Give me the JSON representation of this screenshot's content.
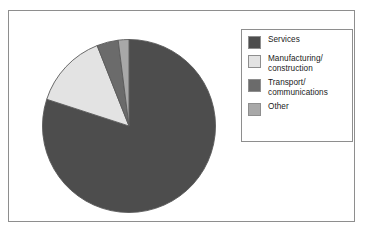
{
  "chart_data": {
    "type": "pie",
    "title": "",
    "subtitle": "",
    "xlabel": "",
    "ylabel": "",
    "grid": false,
    "legend_position": "right",
    "start_angle_deg": 90,
    "direction": "clockwise",
    "labels": [
      "Services",
      "Manufacturing/\nconstruction",
      "Transport/\ncommunications",
      "Other"
    ],
    "values": [
      80,
      14,
      4,
      2
    ],
    "unit": "percent",
    "colors": [
      "#4d4d4d",
      "#e3e3e3",
      "#6b6b6b",
      "#a8a8a8"
    ],
    "slice_edge_color": "#5a5a5a",
    "slices": [
      {
        "label": "Services",
        "value": 80,
        "color": "#4d4d4d"
      },
      {
        "label": "Manufacturing/\nconstruction",
        "value": 14,
        "color": "#e3e3e3"
      },
      {
        "label": "Transport/\ncommunications",
        "value": 4,
        "color": "#6b6b6b"
      },
      {
        "label": "Other",
        "value": 2,
        "color": "#a8a8a8"
      }
    ]
  },
  "legend": {
    "items": [
      {
        "label": "Services",
        "color": "#4d4d4d"
      },
      {
        "label": "Manufacturing/\nconstruction",
        "color": "#e3e3e3"
      },
      {
        "label": "Transport/\ncommunications",
        "color": "#6b6b6b"
      },
      {
        "label": "Other",
        "color": "#a8a8a8"
      }
    ]
  },
  "figure": {
    "border_color": "#8e8e8e",
    "background": "#ffffff"
  }
}
